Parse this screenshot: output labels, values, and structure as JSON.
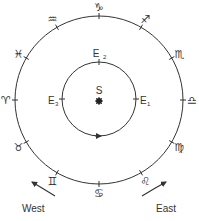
{
  "diagram": {
    "outer_circle": {
      "cx": 99,
      "cy": 100,
      "r": 84
    },
    "inner_circle": {
      "cx": 99,
      "cy": 99,
      "r": 37
    },
    "zodiac": [
      {
        "name": "Capricorn",
        "symbol": "♑",
        "angle_deg": 90
      },
      {
        "name": "Sagittarius",
        "symbol": "♐",
        "angle_deg": 60
      },
      {
        "name": "Scorpio",
        "symbol": "♏",
        "angle_deg": 30
      },
      {
        "name": "Libra",
        "symbol": "♎",
        "angle_deg": 0
      },
      {
        "name": "Virgo",
        "symbol": "♍",
        "angle_deg": -30
      },
      {
        "name": "Leo",
        "symbol": "♌",
        "angle_deg": -60
      },
      {
        "name": "Cancer",
        "symbol": "♋",
        "angle_deg": -90
      },
      {
        "name": "Gemini",
        "symbol": "♊",
        "angle_deg": -120
      },
      {
        "name": "Taurus",
        "symbol": "♉",
        "angle_deg": -150
      },
      {
        "name": "Aries",
        "symbol": "♈",
        "angle_deg": 180
      },
      {
        "name": "Pisces",
        "symbol": "♓",
        "angle_deg": 150
      },
      {
        "name": "Aquarius",
        "symbol": "♒",
        "angle_deg": 120
      }
    ],
    "earth_positions": [
      {
        "label": "E",
        "sub": "1",
        "angle_deg": 0
      },
      {
        "label": "E",
        "sub": "2",
        "angle_deg": 90
      },
      {
        "label": "E",
        "sub": "3",
        "angle_deg": 180
      }
    ],
    "sun": {
      "label": "S"
    },
    "directions": {
      "west": "West",
      "east": "East"
    }
  }
}
